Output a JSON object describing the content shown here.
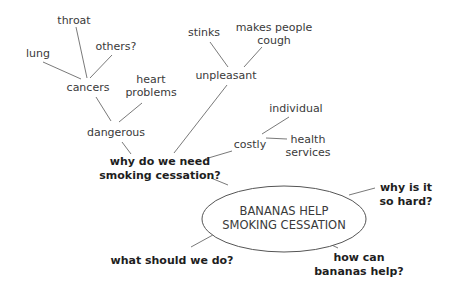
{
  "diagram": {
    "type": "mind-map",
    "central": {
      "line1": "BANANAS HELP",
      "line2": "SMOKING CESSATION"
    },
    "branches": {
      "why_need": {
        "line1": "why do we need",
        "line2": "smoking cessation?"
      },
      "why_hard": {
        "line1": "why is it",
        "line2": "so hard?"
      },
      "what_do": {
        "label": "what should we do?"
      },
      "how_help": {
        "line1": "how can",
        "line2": "bananas help?"
      }
    },
    "nodes": {
      "dangerous": "dangerous",
      "cancers": "cancers",
      "lung": "lung",
      "throat": "throat",
      "others": "others?",
      "heart": {
        "line1": "heart",
        "line2": "problems"
      },
      "unpleasant": "unpleasant",
      "stinks": "stinks",
      "cough": {
        "line1": "makes people",
        "line2": "cough"
      },
      "costly": "costly",
      "individual": "individual",
      "health": {
        "line1": "health",
        "line2": "services"
      }
    },
    "colors": {
      "text": "#3a3a3a",
      "bold_text": "#1e1e1e",
      "lines": "#6a6a6a",
      "background": "#ffffff"
    }
  }
}
